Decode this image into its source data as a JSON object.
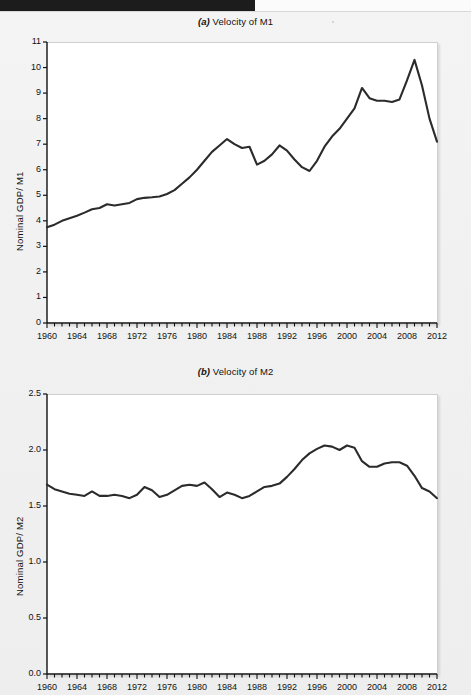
{
  "page": {
    "background_color": "#f1f1f1",
    "header_band_color": "#1c1c1c"
  },
  "charts": [
    {
      "id": "velocity-m1",
      "panel_tag": "(a)",
      "title_text": "Velocity of M1",
      "ylabel": "Nominal GDP/ M1"
    },
    {
      "id": "velocity-m2",
      "panel_tag": "(b)",
      "title_text": "Velocity of M2",
      "ylabel": "Nominal GDP/ M2"
    }
  ],
  "chart_data": [
    {
      "type": "line",
      "title": "(a) Velocity of M1",
      "xlabel": "",
      "ylabel": "Nominal GDP/ M1",
      "xlim": [
        1960,
        2012
      ],
      "ylim": [
        0,
        11
      ],
      "yticks": [
        0,
        1,
        2,
        3,
        4,
        5,
        6,
        7,
        8,
        9,
        10,
        11
      ],
      "ytick_labels": [
        "0",
        "1",
        "2",
        "3",
        "4",
        "5",
        "6",
        "7",
        "8",
        "9",
        "10",
        "11"
      ],
      "xticks": [
        1960,
        1964,
        1968,
        1972,
        1976,
        1980,
        1984,
        1988,
        1992,
        1996,
        2000,
        2004,
        2008,
        2012
      ],
      "xtick_labels": [
        "1960",
        "1964",
        "1968",
        "1972",
        "1976",
        "1980",
        "1984",
        "1988",
        "1992",
        "1996",
        "2000",
        "2004",
        "2008",
        "2012"
      ],
      "minor_tick_interval": 1,
      "grid": false,
      "legend": null,
      "line_color": "#2b2b2b",
      "x": [
        1960,
        1961,
        1962,
        1963,
        1964,
        1965,
        1966,
        1967,
        1968,
        1969,
        1970,
        1971,
        1972,
        1973,
        1974,
        1975,
        1976,
        1977,
        1978,
        1979,
        1980,
        1981,
        1982,
        1983,
        1984,
        1985,
        1986,
        1987,
        1988,
        1989,
        1990,
        1991,
        1992,
        1993,
        1994,
        1995,
        1996,
        1997,
        1998,
        1999,
        2000,
        2001,
        2002,
        2003,
        2004,
        2005,
        2006,
        2007,
        2008,
        2009,
        2010,
        2011,
        2012
      ],
      "values": [
        3.75,
        3.85,
        4.0,
        4.1,
        4.2,
        4.32,
        4.45,
        4.5,
        4.65,
        4.6,
        4.65,
        4.7,
        4.85,
        4.9,
        4.92,
        4.95,
        5.05,
        5.2,
        5.45,
        5.7,
        6.0,
        6.35,
        6.7,
        6.95,
        7.2,
        7.0,
        6.85,
        6.9,
        6.2,
        6.35,
        6.6,
        6.95,
        6.75,
        6.4,
        6.1,
        5.95,
        6.35,
        6.9,
        7.3,
        7.6,
        8.0,
        8.4,
        9.2,
        8.8,
        8.7,
        8.7,
        8.65,
        8.75,
        9.5,
        10.3,
        9.3,
        8.0,
        7.1
      ],
      "annotations": [
        {
          "year": 1960,
          "value": 3.75,
          "note": "series start"
        },
        {
          "year": 1981,
          "value": 7.2,
          "note": "local peak"
        },
        {
          "year": 1995,
          "value": 5.95,
          "note": "local trough"
        },
        {
          "year": 2009,
          "value": 10.3,
          "note": "series maximum"
        },
        {
          "year": 2012,
          "value": 7.1,
          "note": "series end"
        }
      ]
    },
    {
      "type": "line",
      "title": "(b) Velocity of M2",
      "xlabel": "",
      "ylabel": "Nominal GDP/ M2",
      "xlim": [
        1960,
        2012
      ],
      "ylim": [
        0.0,
        2.5
      ],
      "yticks": [
        0.0,
        0.5,
        1.0,
        1.5,
        2.0,
        2.5
      ],
      "ytick_labels": [
        "0.0",
        "0.5",
        "1.0",
        "1.5",
        "2.0",
        "2.5"
      ],
      "xticks": [
        1960,
        1964,
        1968,
        1972,
        1976,
        1980,
        1984,
        1988,
        1992,
        1996,
        2000,
        2004,
        2008,
        2012
      ],
      "xtick_labels": [
        "1960",
        "1964",
        "1968",
        "1972",
        "1976",
        "1980",
        "1984",
        "1988",
        "1992",
        "1996",
        "2000",
        "2004",
        "2008",
        "2012"
      ],
      "minor_tick_interval": 1,
      "grid": false,
      "legend": null,
      "line_color": "#2b2b2b",
      "x": [
        1960,
        1961,
        1962,
        1963,
        1964,
        1965,
        1966,
        1967,
        1968,
        1969,
        1970,
        1971,
        1972,
        1973,
        1974,
        1975,
        1976,
        1977,
        1978,
        1979,
        1980,
        1981,
        1982,
        1983,
        1984,
        1985,
        1986,
        1987,
        1988,
        1989,
        1990,
        1991,
        1992,
        1993,
        1994,
        1995,
        1996,
        1997,
        1998,
        1999,
        2000,
        2001,
        2002,
        2003,
        2004,
        2005,
        2006,
        2007,
        2008,
        2009,
        2010,
        2011,
        2012
      ],
      "values": [
        1.69,
        1.65,
        1.63,
        1.61,
        1.6,
        1.59,
        1.63,
        1.59,
        1.59,
        1.6,
        1.59,
        1.57,
        1.6,
        1.67,
        1.64,
        1.58,
        1.6,
        1.64,
        1.68,
        1.69,
        1.68,
        1.71,
        1.65,
        1.58,
        1.62,
        1.6,
        1.57,
        1.59,
        1.63,
        1.67,
        1.68,
        1.7,
        1.76,
        1.83,
        1.91,
        1.97,
        2.01,
        2.04,
        2.03,
        2.0,
        2.04,
        2.02,
        1.9,
        1.85,
        1.85,
        1.88,
        1.89,
        1.89,
        1.86,
        1.77,
        1.66,
        1.63,
        1.57
      ],
      "annotations": [
        {
          "year": 1960,
          "value": 1.69,
          "note": "series start"
        },
        {
          "year": 1971,
          "value": 1.57,
          "note": "early trough"
        },
        {
          "year": 2000,
          "value": 2.04,
          "note": "series maximum"
        },
        {
          "year": 2012,
          "value": 1.57,
          "note": "series end"
        }
      ]
    }
  ]
}
